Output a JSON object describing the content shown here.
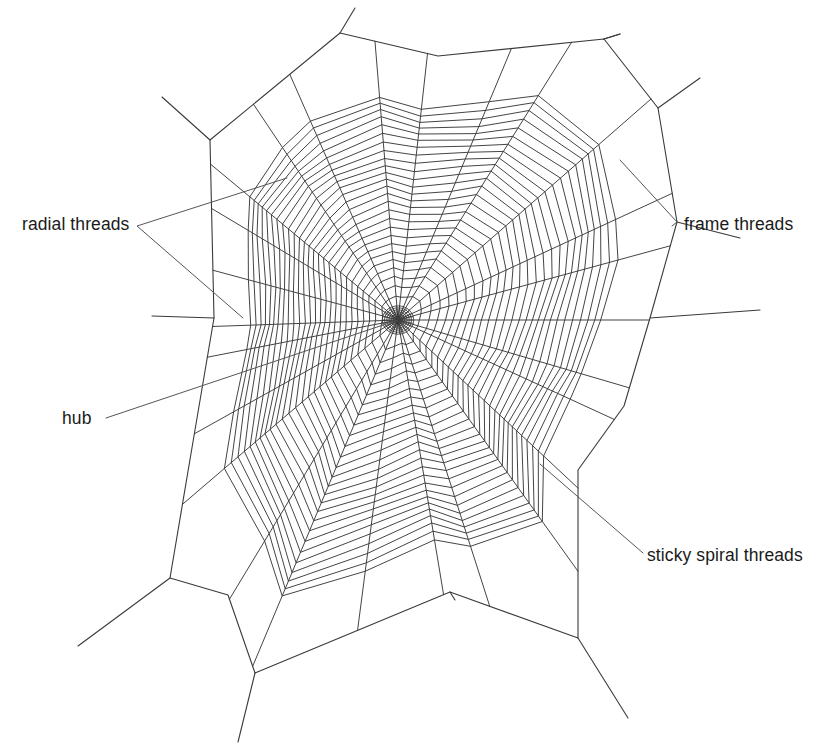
{
  "diagram": {
    "background_color": "#ffffff",
    "line_color": "#3a3a3a",
    "text_color": "#1a1a1a"
  },
  "labels": {
    "radial": "radial threads",
    "frame": "frame threads",
    "hub": "hub",
    "sticky": "sticky spiral threads"
  },
  "chart_data": {
    "type": "diagram",
    "hub": {
      "cx": 398,
      "cy": 320,
      "radius": 15,
      "mesh_rings": 7,
      "mesh_spokes": 26
    },
    "radial_count": 26,
    "spiral_rings": 26,
    "annotations": [
      {
        "name": "radial threads",
        "text_x": 22,
        "text_y": 225,
        "target_x": 243,
        "target_y": 318
      },
      {
        "name": "frame threads",
        "text_x": 684,
        "text_y": 225,
        "target_x": 677,
        "target_y": 222
      },
      {
        "name": "hub",
        "text_x": 62,
        "text_y": 419,
        "target_x": 398,
        "target_y": 320
      },
      {
        "name": "sticky spiral threads",
        "text_x": 647,
        "text_y": 556,
        "target_x": 540,
        "target_y": 464
      }
    ],
    "frame_vertices": [
      [
        210,
        140
      ],
      [
        340,
        33
      ],
      [
        438,
        56
      ],
      [
        604,
        39
      ],
      [
        658,
        108
      ],
      [
        677,
        222
      ],
      [
        650,
        318
      ],
      [
        624,
        406
      ],
      [
        578,
        470
      ],
      [
        578,
        638
      ],
      [
        450,
        592
      ],
      [
        255,
        673
      ],
      [
        228,
        595
      ],
      [
        170,
        578
      ],
      [
        196,
        424
      ],
      [
        214,
        318
      ]
    ],
    "anchor_lines": [
      [
        [
          210,
          140
        ],
        [
          162,
          97
        ]
      ],
      [
        [
          340,
          33
        ],
        [
          340,
          33
        ]
      ],
      [
        [
          604,
          39
        ],
        [
          620,
          34
        ]
      ],
      [
        [
          677,
          222
        ],
        [
          740,
          238
        ]
      ],
      [
        [
          650,
          318
        ],
        [
          760,
          310
        ]
      ],
      [
        [
          578,
          638
        ],
        [
          628,
          718
        ]
      ],
      [
        [
          255,
          673
        ],
        [
          238,
          742
        ]
      ],
      [
        [
          170,
          578
        ],
        [
          78,
          646
        ]
      ],
      [
        [
          214,
          318
        ],
        [
          152,
          316
        ]
      ]
    ]
  }
}
